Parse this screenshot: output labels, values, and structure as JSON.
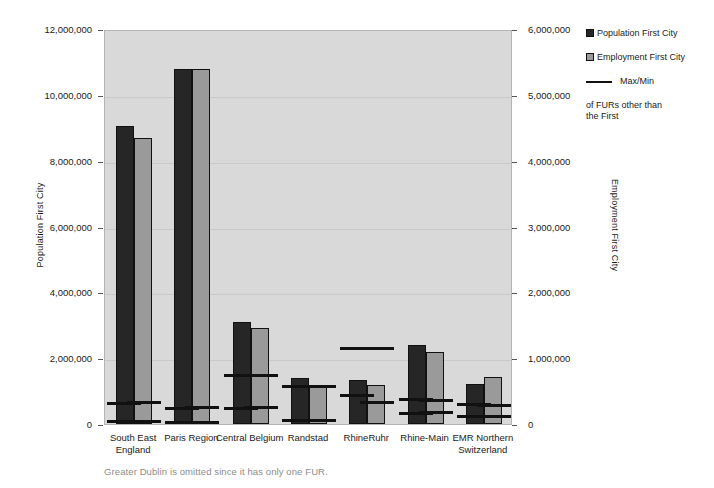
{
  "chart_data": {
    "type": "bar",
    "title": "",
    "categories": [
      "South East England",
      "Paris Region",
      "Central Belgium",
      "Randstad",
      "RhineRuhr",
      "Rhine-Main",
      "EMR Northern Switzerland"
    ],
    "series": [
      {
        "name": "Population First City",
        "axis": "left",
        "color": "#262626",
        "values": [
          9060000,
          10780000,
          3100000,
          1400000,
          1330000,
          2400000,
          1210000
        ]
      },
      {
        "name": "Employment First City",
        "axis": "right",
        "color": "#9a9a9a",
        "values": [
          4340000,
          5390000,
          1460000,
          590000,
          600000,
          1100000,
          710000
        ]
      }
    ],
    "markers": {
      "name": "Max/Min of FURs other than the First",
      "color": "#111111",
      "population_axis": [
        {
          "category": "South East England",
          "max": 620000,
          "min": 80000
        },
        {
          "category": "Paris Region",
          "max": 470000,
          "min": 60000
        },
        {
          "category": "Central Belgium",
          "max": 1480000,
          "min": 480000
        },
        {
          "category": "Randstad",
          "max": 1130000,
          "min": 120000
        },
        {
          "category": "RhineRuhr",
          "max": 2300000,
          "min": 880000
        },
        {
          "category": "Rhine-Main",
          "max": 740000,
          "min": 310000
        },
        {
          "category": "EMR Northern Switzerland",
          "max": 580000,
          "min": 240000
        }
      ],
      "employment_axis": [
        {
          "category": "South East England",
          "max": 330000,
          "min": 45000
        },
        {
          "category": "Paris Region",
          "max": 250000,
          "min": 30000
        },
        {
          "category": "Central Belgium",
          "max": 740000,
          "min": 250000
        },
        {
          "category": "Randstad",
          "max": 570000,
          "min": 60000
        },
        {
          "category": "RhineRuhr",
          "max": 1140000,
          "min": 330000
        },
        {
          "category": "Rhine-Main",
          "max": 360000,
          "min": 180000
        },
        {
          "category": "EMR Northern Switzerland",
          "max": 285000,
          "min": 120000
        }
      ]
    },
    "left_axis": {
      "label": "Population First City",
      "min": 0,
      "max": 12000000,
      "step": 2000000,
      "ticks": [
        "0",
        "2,000,000",
        "4,000,000",
        "6,000,000",
        "8,000,000",
        "10,000,000",
        "12,000,000"
      ]
    },
    "right_axis": {
      "label": "Employment First City",
      "min": 0,
      "max": 6000000,
      "step": 1000000,
      "ticks": [
        "0",
        "1,000,000",
        "2,000,000",
        "3,000,000",
        "4,000,000",
        "5,000,000",
        "6,000,000"
      ]
    },
    "grid": true,
    "legend_position": "right"
  },
  "legend": {
    "population_label": "Population First City",
    "employment_label": "Employment First City",
    "maxmin_label": "Max/Min",
    "maxmin_label_line2": "of FURs other than",
    "maxmin_label_line3": "the First"
  },
  "axes": {
    "left_title": "Population First City",
    "right_title": "Employment First City"
  },
  "caption": "Greater Dublin is omitted since it has only one FUR.",
  "colors": {
    "population_bar": "#262626",
    "employment_bar": "#9a9a9a",
    "plot_background": "#d9d9d9",
    "marker_line": "#111111",
    "caption_text": "#8c8c8c"
  }
}
